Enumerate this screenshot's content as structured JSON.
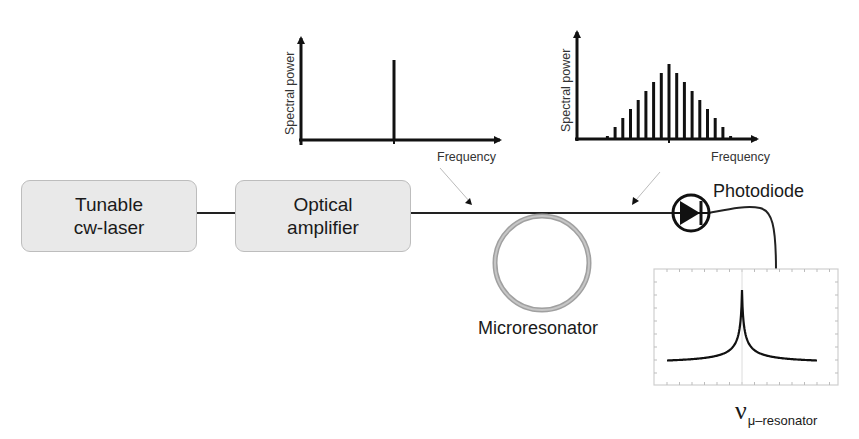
{
  "diagram": {
    "blocks": [
      {
        "id": "laser",
        "lines": [
          "Tunable",
          "cw-laser"
        ]
      },
      {
        "id": "amplifier",
        "lines": [
          "Optical",
          "amplifier"
        ]
      }
    ],
    "labels": {
      "microresonator": "Microresonator",
      "photodiode": "Photodiode",
      "nu_symbol": "ν",
      "nu_subscript": "μ–resonator"
    },
    "spectrum_input": {
      "ylabel": "Spectral power",
      "xlabel": "Frequency",
      "description": "Single continuous-wave laser line"
    },
    "spectrum_output": {
      "ylabel": "Spectral power",
      "xlabel": "Frequency",
      "description": "Frequency comb, 17 lines with triangular envelope"
    },
    "resonance_plot": {
      "description": "Lorentzian resonance peak at the microresonator frequency"
    },
    "colors": {
      "line": "#111111",
      "block_fill": "#e9e9e9",
      "block_border": "#bdbdbd",
      "ring": "#9a9a9a",
      "pointer": "#b5b5b5",
      "frame": "#d0d0d0"
    }
  },
  "chart_data": [
    {
      "type": "bar",
      "title": "Input spectrum",
      "xlabel": "Frequency",
      "ylabel": "Spectral power",
      "categories": [
        "f0"
      ],
      "values": [
        0.75
      ],
      "ylim": [
        0,
        1
      ]
    },
    {
      "type": "bar",
      "title": "Comb spectrum",
      "xlabel": "Frequency",
      "ylabel": "Spectral power",
      "categories": [
        "-8",
        "-7",
        "-6",
        "-5",
        "-4",
        "-3",
        "-2",
        "-1",
        "0",
        "1",
        "2",
        "3",
        "4",
        "5",
        "6",
        "7",
        "8"
      ],
      "values": [
        0.04,
        0.16,
        0.28,
        0.4,
        0.52,
        0.64,
        0.76,
        0.88,
        1.0,
        0.88,
        0.76,
        0.64,
        0.52,
        0.4,
        0.28,
        0.16,
        0.04
      ],
      "ylim": [
        0,
        1.1
      ]
    },
    {
      "type": "line",
      "title": "Photodiode transmission resonance",
      "xlabel": "",
      "ylabel": "",
      "series": [
        {
          "name": "Lorentzian",
          "shape": "peak centered at ν_μ-resonator",
          "peak": 1.0,
          "baseline": 0.05
        }
      ]
    }
  ]
}
